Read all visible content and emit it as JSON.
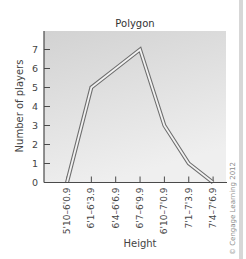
{
  "chart_data": {
    "type": "line",
    "style": "frequency polygon (double-outline stroke)",
    "title": "Polygon",
    "xlabel": "Height",
    "ylabel": "Number of players",
    "categories": [
      "5'10–6'0.9",
      "6'1–6'3.9",
      "6'4–6'6.9",
      "6'7–6'9.9",
      "6'10–7'0.9",
      "7'1–7'3.9",
      "7'4–7'6.9"
    ],
    "values": [
      0,
      5,
      6,
      7,
      3,
      1,
      0
    ],
    "yticks": [
      0,
      1,
      2,
      3,
      4,
      5,
      6,
      7
    ],
    "ylim": [
      0,
      7.6
    ],
    "grid": false,
    "legend": null,
    "background": "light gray gradient",
    "annotations": [
      "© Cengage Learning 2012"
    ]
  },
  "copyright": "© Cengage Learning 2012",
  "colors": {
    "line": "#6e6e6e",
    "axis": "#4a4a4a",
    "plot_bg_top": "#d4d4d4",
    "plot_bg_bottom": "#ededed"
  }
}
